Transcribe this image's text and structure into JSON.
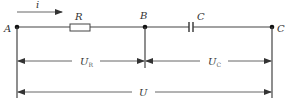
{
  "diagram": {
    "type": "RC series circuit",
    "current_label": "i",
    "nodes": [
      {
        "id": "A",
        "label": "A"
      },
      {
        "id": "B",
        "label": "B"
      },
      {
        "id": "C",
        "label": "C"
      }
    ],
    "components": [
      {
        "id": "R",
        "label": "R",
        "kind": "resistor",
        "between": [
          "A",
          "B"
        ]
      },
      {
        "id": "C",
        "label": "C",
        "kind": "capacitor",
        "between": [
          "B",
          "C"
        ]
      }
    ],
    "voltages": [
      {
        "id": "UR",
        "main": "U",
        "sub": "R",
        "between": [
          "A",
          "B"
        ]
      },
      {
        "id": "UC",
        "main": "U",
        "sub": "C",
        "between": [
          "B",
          "C"
        ]
      },
      {
        "id": "U",
        "main": "U",
        "sub": "",
        "between": [
          "A",
          "C"
        ]
      }
    ],
    "colors": {
      "wire": "#444444",
      "text": "#333333",
      "background": "#ffffff"
    }
  }
}
